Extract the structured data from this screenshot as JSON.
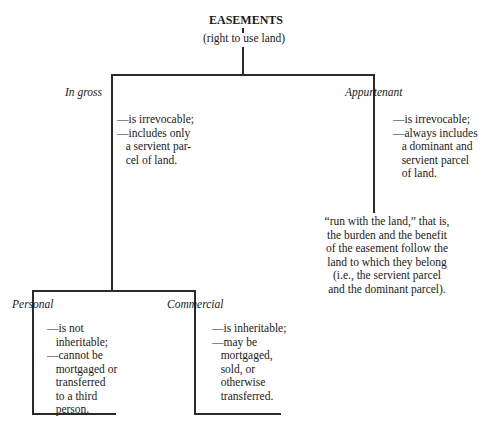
{
  "root": {
    "title": "EASEMENTS",
    "subtitle": "(right to use land)"
  },
  "branches": {
    "in_gross": {
      "label": "In gross",
      "notes": [
        "—is irrevocable;",
        "—includes only",
        "   a servient par-",
        "   cel of land."
      ]
    },
    "appurtenant": {
      "label": "Appurtenant",
      "notes": [
        "—is irrevocable;",
        "—always includes",
        "   a dominant and",
        "   servient parcel",
        "   of land."
      ],
      "run_with_land": [
        "“run with the land,” that is,",
        "the burden and the benefit",
        "of the easement follow the",
        "land to which they belong",
        "(i.e., the servient parcel",
        "and the dominant parcel)."
      ]
    },
    "personal": {
      "label": "Personal",
      "notes": [
        "—is not",
        "   inheritable;",
        "—cannot be",
        "   mortgaged or",
        "   transferred",
        "   to a third",
        "   person."
      ]
    },
    "commercial": {
      "label": "Commercial",
      "notes": [
        "—is inheritable;",
        "—may be",
        "   mortgaged,",
        "   sold, or",
        "   otherwise",
        "   transferred."
      ]
    }
  }
}
